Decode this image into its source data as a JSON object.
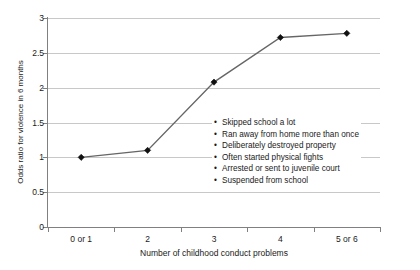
{
  "chart_data": {
    "type": "line",
    "title": "",
    "subtitle": "",
    "xlabel": "Number of childhood conduct problems",
    "ylabel": "Odds ratio for violence in 6 months",
    "categories": [
      "0 or 1",
      "2",
      "3",
      "4",
      "5 or 6"
    ],
    "values": [
      1.0,
      1.1,
      2.08,
      2.72,
      2.78
    ],
    "series": [
      {
        "name": "Odds ratio for violence in 6 months",
        "values": [
          1.0,
          1.1,
          2.08,
          2.72,
          2.78
        ]
      }
    ],
    "ylim": [
      0,
      3
    ],
    "yticks": [
      0,
      0.5,
      1,
      1.5,
      2,
      2.5,
      3
    ],
    "ytick_labels": [
      "0",
      "0.5",
      "1",
      "1.5",
      "2",
      "2.5",
      "3"
    ],
    "grid": "horizontal",
    "legend": "none",
    "marker": "filled-diamond",
    "line_color": "#666666",
    "marker_color": "#111111",
    "grid_color": "#c8c8c8",
    "axis_color": "#808080",
    "annotations": {
      "position": "inside-plot-right",
      "title": "",
      "items": [
        "Skipped school a lot",
        "Ran away from home more than once",
        "Deliberately destroyed property",
        "Often started physical fights",
        "Arrested or sent to juvenile court",
        "Suspended from school"
      ],
      "bullet_glyph": "•"
    }
  }
}
